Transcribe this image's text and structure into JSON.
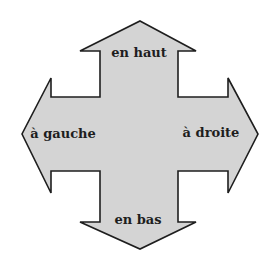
{
  "diagram": {
    "shape": "four-way-arrow",
    "fill_color": "#d4d4d4",
    "stroke_color": "#1e1e1e",
    "labels": {
      "up": "en haut",
      "left": "à gauche",
      "right": "à droite",
      "down": "en bas"
    }
  }
}
